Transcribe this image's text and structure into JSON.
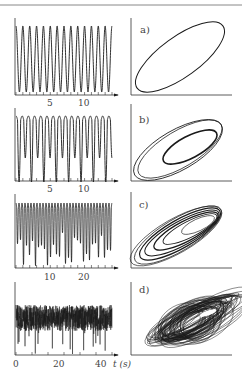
{
  "figure": {
    "rule_color": "#888888",
    "line_color": "#1a1a1a",
    "axis_label_t": "t (s)"
  },
  "chart_data": [
    {
      "type": "line",
      "panel": "a-left",
      "title": "",
      "xlabel": "",
      "ylabel": "",
      "x_ticks": [
        "5",
        "10"
      ],
      "xlim": [
        0,
        14
      ],
      "description": "Periodic oscillation (period-1), ~14 cycles",
      "series": [
        {
          "name": "signal",
          "period": 1.0,
          "cycles": 14
        }
      ]
    },
    {
      "type": "line",
      "panel": "a-right",
      "label": "a)",
      "description": "Phase portrait: single closed limit cycle (ellipse)"
    },
    {
      "type": "line",
      "panel": "b-left",
      "x_ticks": [
        "5",
        "10"
      ],
      "xlim": [
        0,
        14
      ],
      "description": "Period-2 oscillation, alternating deep and shallow troughs",
      "series": [
        {
          "name": "signal",
          "period": 2.0,
          "cycles": 8
        }
      ]
    },
    {
      "type": "line",
      "panel": "b-right",
      "label": "b)",
      "description": "Phase portrait: period-2 double loop"
    },
    {
      "type": "line",
      "panel": "c-left",
      "x_ticks": [
        "10",
        "20"
      ],
      "xlim": [
        0,
        28
      ],
      "description": "Higher-period / near-chaotic oscillation",
      "series": [
        {
          "name": "signal",
          "cycles": 16
        }
      ]
    },
    {
      "type": "line",
      "panel": "c-right",
      "label": "c)",
      "description": "Phase portrait: multi-loop attractor"
    },
    {
      "type": "line",
      "panel": "d-left",
      "x_ticks": [
        "0",
        "20",
        "40"
      ],
      "xlim": [
        0,
        45
      ],
      "xlabel": "t (s)",
      "description": "Chaotic oscillation",
      "series": [
        {
          "name": "signal",
          "behavior": "chaotic"
        }
      ]
    },
    {
      "type": "line",
      "panel": "d-right",
      "label": "d)",
      "description": "Phase portrait: strange (chaotic) attractor"
    }
  ],
  "panels": [
    {
      "label": "a)",
      "ticks": [
        {
          "text": "5",
          "x": 50
        },
        {
          "text": "10",
          "x": 84
        }
      ]
    },
    {
      "label": "b)",
      "ticks": [
        {
          "text": "5",
          "x": 50
        },
        {
          "text": "10",
          "x": 84
        }
      ]
    },
    {
      "label": "c)",
      "ticks": [
        {
          "text": "10",
          "x": 50
        },
        {
          "text": "20",
          "x": 84
        }
      ]
    },
    {
      "label": "d)",
      "ticks": [
        {
          "text": "0",
          "x": 16
        },
        {
          "text": "20",
          "x": 58
        },
        {
          "text": "40",
          "x": 100
        }
      ]
    }
  ]
}
